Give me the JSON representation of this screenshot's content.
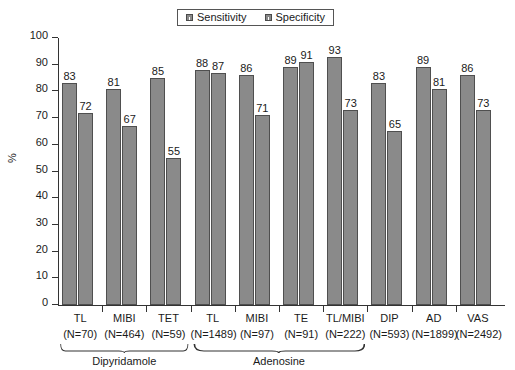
{
  "chart_data": {
    "type": "bar",
    "title": "",
    "xlabel": "",
    "ylabel": "%",
    "ylim": [
      0,
      100
    ],
    "yticks": [
      0,
      10,
      20,
      30,
      40,
      50,
      60,
      70,
      80,
      90,
      100
    ],
    "grid": false,
    "legend_position": "top-center",
    "legend": [
      "Sensitivity",
      "Specificity"
    ],
    "categories": [
      "TL",
      "MIBI",
      "TET",
      "TL",
      "MIBI",
      "TE",
      "TL/MIBI",
      "DIP",
      "AD",
      "VAS"
    ],
    "category_sublabels": [
      "(N=70)",
      "(N=464)",
      "(N=59)",
      "(N=1489)",
      "(N=97)",
      "(N=91)",
      "(N=222)",
      "(N=593)",
      "(N=1899)",
      "(N=2492)"
    ],
    "series": [
      {
        "name": "Sensitivity",
        "values": [
          83,
          81,
          85,
          88,
          86,
          89,
          93,
          83,
          89,
          86
        ]
      },
      {
        "name": "Specificity",
        "values": [
          72,
          67,
          55,
          87,
          71,
          91,
          73,
          65,
          81,
          73
        ]
      }
    ],
    "annotations": [
      {
        "label": "Dipyridamole",
        "spans": [
          0,
          2
        ]
      },
      {
        "label": "Adenosine",
        "spans": [
          3,
          6
        ]
      }
    ],
    "colors": {
      "bar_fill": "#8a8a8a",
      "bar_edge": "#4f4f4f",
      "axis": "#333333",
      "text": "#1a1a1a"
    }
  },
  "groups": [
    {
      "name": "TL",
      "n": "(N=70)",
      "sensitivity": 83,
      "specificity": 72
    },
    {
      "name": "MIBI",
      "n": "(N=464)",
      "sensitivity": 81,
      "specificity": 67
    },
    {
      "name": "TET",
      "n": "(N=59)",
      "sensitivity": 85,
      "specificity": 55
    },
    {
      "name": "TL",
      "n": "(N=1489)",
      "sensitivity": 88,
      "specificity": 87
    },
    {
      "name": "MIBI",
      "n": "(N=97)",
      "sensitivity": 86,
      "specificity": 71
    },
    {
      "name": "TE",
      "n": "(N=91)",
      "sensitivity": 89,
      "specificity": 91
    },
    {
      "name": "TL/MIBI",
      "n": "(N=222)",
      "sensitivity": 93,
      "specificity": 73
    },
    {
      "name": "DIP",
      "n": "(N=593)",
      "sensitivity": 83,
      "specificity": 65
    },
    {
      "name": "AD",
      "n": "(N=1899)",
      "sensitivity": 89,
      "specificity": 81
    },
    {
      "name": "VAS",
      "n": "(N=2492)",
      "sensitivity": 86,
      "specificity": 73
    }
  ],
  "legend": {
    "items": [
      {
        "label": "Sensitivity"
      },
      {
        "label": "Specificity"
      }
    ]
  },
  "yaxis": {
    "label": "%",
    "ticks": [
      "100",
      "90",
      "80",
      "70",
      "60",
      "50",
      "40",
      "30",
      "20",
      "10",
      "0"
    ]
  },
  "brackets": [
    {
      "label": "Dipyridamole"
    },
    {
      "label": "Adenosine"
    }
  ]
}
